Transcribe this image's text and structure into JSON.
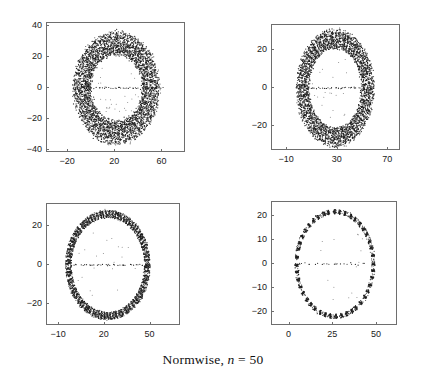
{
  "figure": {
    "caption_prefix": "Normwise,",
    "caption_variable": "n",
    "caption_equals": "=",
    "caption_value": "50",
    "caption_full": "Normwise, n = 50",
    "background_color": "#ffffff",
    "axis_color": "#6e6e6e",
    "marker_color": "#1a1a1a"
  },
  "chart_data": [
    {
      "id": "panel-top-left",
      "type": "scatter",
      "title": "",
      "xlabel": "",
      "ylabel": "",
      "xlim": [
        -38,
        80
      ],
      "ylim": [
        -42,
        42
      ],
      "xticks": [
        -20,
        20,
        60
      ],
      "xticklabels": [
        "-20",
        "20",
        "60"
      ],
      "yticks": [
        -40,
        -20,
        0,
        20,
        40
      ],
      "yticklabels": [
        "-40",
        "-20",
        "0",
        "20",
        "40"
      ],
      "grid": false,
      "legend": null,
      "annulus": {
        "center_x": 21,
        "center_y": 0,
        "inner_radius": 22,
        "outer_radius": 37,
        "n_points": 2600,
        "radial_spread": 0.9,
        "ellipse_ratio": 1.0
      },
      "real_axis_points": {
        "count": 70,
        "x_min": -16,
        "x_max": 60,
        "y": 0
      },
      "interior_points": 26
    },
    {
      "id": "panel-top-right",
      "type": "scatter",
      "title": "",
      "xlabel": "",
      "ylabel": "",
      "xlim": [
        -22,
        80
      ],
      "ylim": [
        -33,
        33
      ],
      "xticks": [
        -10,
        30,
        70
      ],
      "xticklabels": [
        "-10",
        "30",
        "70"
      ],
      "yticks": [
        -20,
        0,
        20
      ],
      "yticklabels": [
        "-20",
        "0",
        "20"
      ],
      "grid": false,
      "legend": null,
      "annulus": {
        "center_x": 28,
        "center_y": 0,
        "inner_radius": 21,
        "outer_radius": 31,
        "n_points": 2200,
        "radial_spread": 0.85,
        "ellipse_ratio": 1.0
      },
      "real_axis_points": {
        "count": 62,
        "x_min": -4,
        "x_max": 58,
        "y": 0
      },
      "interior_points": 22
    },
    {
      "id": "panel-bottom-left",
      "type": "scatter",
      "title": "",
      "xlabel": "",
      "ylabel": "",
      "xlim": [
        -18,
        70
      ],
      "ylim": [
        -31,
        31
      ],
      "xticks": [
        -10,
        20,
        50
      ],
      "xticklabels": [
        "-10",
        "20",
        "50"
      ],
      "yticks": [
        -20,
        0,
        20
      ],
      "yticklabels": [
        "-20",
        "0",
        "20"
      ],
      "grid": false,
      "legend": null,
      "annulus": {
        "center_x": 22,
        "center_y": 0,
        "inner_radius": 24,
        "outer_radius": 28,
        "n_points": 1500,
        "radial_spread": 0.45,
        "ellipse_ratio": 1.0
      },
      "real_axis_points": {
        "count": 52,
        "x_min": -2,
        "x_max": 48,
        "y": 0
      },
      "interior_points": 20
    },
    {
      "id": "panel-bottom-right",
      "type": "scatter",
      "title": "",
      "xlabel": "",
      "ylabel": "",
      "xlim": [
        -10,
        62
      ],
      "ylim": [
        -26,
        26
      ],
      "xticks": [
        0,
        25,
        50
      ],
      "xticklabels": [
        "0",
        "25",
        "50"
      ],
      "yticks": [
        -20,
        -10,
        0,
        10,
        20
      ],
      "yticklabels": [
        "-20",
        "-10",
        "0",
        "10",
        "20"
      ],
      "grid": false,
      "legend": null,
      "annulus": {
        "center_x": 26,
        "center_y": 0,
        "inner_radius": 21,
        "outer_radius": 23,
        "n_points": 800,
        "radial_spread": 0.3,
        "ellipse_ratio": 1.0
      },
      "real_axis_points": {
        "count": 34,
        "x_min": 4,
        "x_max": 44,
        "y": 0
      },
      "interior_points": 16
    }
  ]
}
